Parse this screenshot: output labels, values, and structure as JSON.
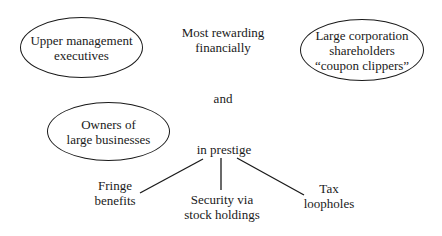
{
  "diagram": {
    "nodes": {
      "upper_management": {
        "line1": "Upper management",
        "line2": "executives"
      },
      "shareholders": {
        "line1": "Large corporation",
        "line2": "shareholders",
        "line3": "“coupon clippers”"
      },
      "owners": {
        "line1": "Owners of",
        "line2": "large businesses"
      }
    },
    "labels": {
      "most_rewarding": {
        "line1": "Most rewarding",
        "line2": "financially"
      },
      "and": "and",
      "in_prestige": "in prestige"
    },
    "branches": {
      "fringe": {
        "line1": "Fringe",
        "line2": "benefits"
      },
      "security": {
        "line1": "Security via",
        "line2": "stock holdings"
      },
      "tax": {
        "line1": "Tax",
        "line2": "loopholes"
      }
    },
    "colors": {
      "ink": "#1a1a1a",
      "background": "#ffffff"
    }
  }
}
